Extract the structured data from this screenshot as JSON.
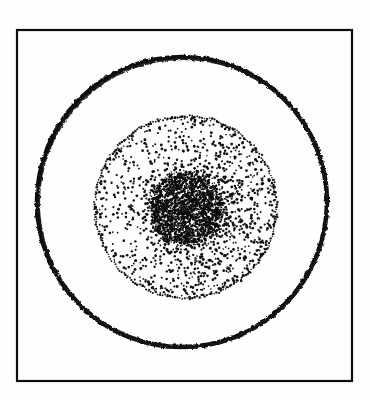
{
  "figure": {
    "title": "Concentric zone stipple diagram",
    "canvas": {
      "width": 371,
      "height": 400,
      "background": "#fefefe"
    },
    "ink_color": "#0a0a0a",
    "frame": {
      "name": "outer-frame",
      "x": 17,
      "y": 30,
      "width": 335,
      "height": 351,
      "stroke": "#111111",
      "stroke_width": 2.2,
      "fill": "none"
    },
    "outer_circle": {
      "name": "outer-ring",
      "cx": 182,
      "cy": 202,
      "r": 145,
      "stroke": "#0d0d0d",
      "stroke_width": 4.6,
      "fill": "none",
      "style": "hand-drawn irregular"
    },
    "stipple_annulus": {
      "name": "stipple-annulus",
      "cx": 186,
      "cy": 207,
      "r": 91,
      "inner_r": 38,
      "dot_count": 1150,
      "dot_radius_min": 0.8,
      "dot_radius_max": 1.5,
      "color": "#121212",
      "density": "increases inward and toward right/lower-right"
    },
    "core_disc": {
      "name": "dense-core",
      "cx": 186,
      "cy": 208,
      "r": 38,
      "dot_count": 2600,
      "dot_radius_min": 0.6,
      "dot_radius_max": 1.3,
      "color": "#0b0b0b",
      "density": "very dense / near solid"
    },
    "boundary_dots": {
      "name": "annulus-boundary",
      "count": 230,
      "radius": 91,
      "color": "#151515"
    }
  },
  "chart_data": {
    "type": "scatter",
    "title": "Concentric zone stipple diagram",
    "xlabel": "",
    "ylabel": "",
    "xlim": [
      0,
      371
    ],
    "ylim": [
      0,
      400
    ],
    "grid": false,
    "legend": "none",
    "annotations": [],
    "series": [
      {
        "name": "outer-ring-outline",
        "kind": "circle-outline",
        "cx": 182,
        "cy": 202,
        "r": 145,
        "values": [
          145
        ]
      },
      {
        "name": "annulus-boundary-outline",
        "kind": "circle-outline",
        "cx": 186,
        "cy": 207,
        "r": 91,
        "values": [
          91
        ]
      },
      {
        "name": "annulus-stipple",
        "kind": "point-cloud",
        "cx": 186,
        "cy": 207,
        "r_inner": 38,
        "r_outer": 91,
        "values": [
          1150
        ]
      },
      {
        "name": "core-stipple",
        "kind": "point-cloud",
        "cx": 186,
        "cy": 208,
        "r_inner": 0,
        "r_outer": 38,
        "values": [
          2600
        ]
      }
    ]
  }
}
